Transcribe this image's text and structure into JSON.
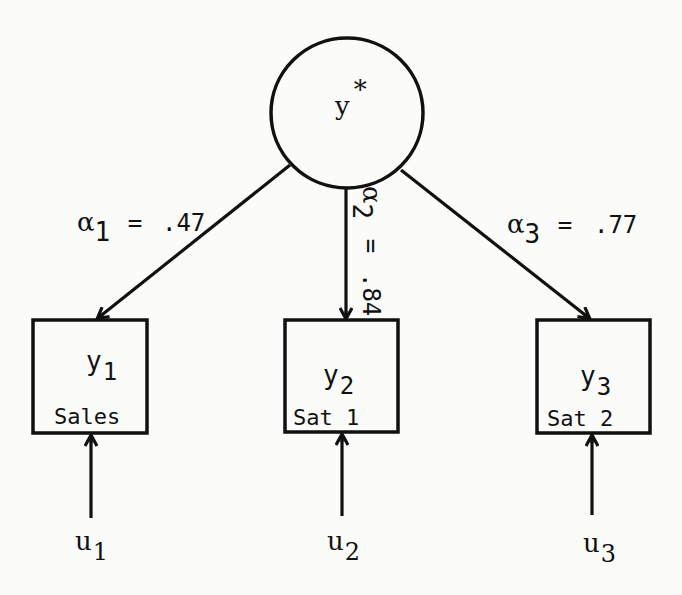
{
  "diagram": {
    "type": "path diagram (latent variable measurement model)",
    "stroke_color": "#111111",
    "background_color": "#fbfbfa",
    "latent": {
      "id": "ystar",
      "label_base": "y",
      "label_sup": "*",
      "shape": "circle"
    },
    "indicators": [
      {
        "id": "y1",
        "label_base": "y",
        "label_sub": "1",
        "caption": "Sales",
        "shape": "box"
      },
      {
        "id": "y2",
        "label_base": "y",
        "label_sub": "2",
        "caption": "Sat 1",
        "shape": "box"
      },
      {
        "id": "y3",
        "label_base": "y",
        "label_sub": "3",
        "caption": "Sat 2",
        "shape": "box"
      }
    ],
    "loadings": [
      {
        "from": "ystar",
        "to": "y1",
        "symbol": "α",
        "sub": "1",
        "eq": "=",
        "value": ".47"
      },
      {
        "from": "ystar",
        "to": "y2",
        "symbol": "α",
        "sub": "2",
        "eq": "=",
        "value": ".84"
      },
      {
        "from": "ystar",
        "to": "y3",
        "symbol": "α",
        "sub": "3",
        "eq": "=",
        "value": ".77"
      }
    ],
    "errors": [
      {
        "to": "y1",
        "label_base": "u",
        "label_sub": "1"
      },
      {
        "to": "y2",
        "label_base": "u",
        "label_sub": "2"
      },
      {
        "to": "y3",
        "label_base": "u",
        "label_sub": "3"
      }
    ]
  }
}
